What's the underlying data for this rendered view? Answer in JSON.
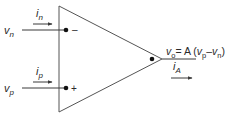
{
  "diagram": {
    "inputs": {
      "inverting": {
        "voltage": {
          "base": "v",
          "sub": "n"
        },
        "current": {
          "base": "i",
          "sub": "n"
        },
        "terminal_sign": "–"
      },
      "noninverting": {
        "voltage": {
          "base": "v",
          "sub": "p"
        },
        "current": {
          "base": "i",
          "sub": "p"
        },
        "terminal_sign": "+"
      }
    },
    "output": {
      "equation": {
        "lhs_base": "v",
        "lhs_sub": "o",
        "eq": "= A (",
        "t1_base": "v",
        "t1_sub": "p",
        "minus": "–",
        "t2_base": "v",
        "t2_sub": "n",
        "close": ")"
      },
      "current": {
        "base": "i",
        "sub": "A"
      }
    },
    "colors": {
      "line": "#3a3a3a",
      "text": "#2a2a2a",
      "body": "#555555"
    }
  }
}
